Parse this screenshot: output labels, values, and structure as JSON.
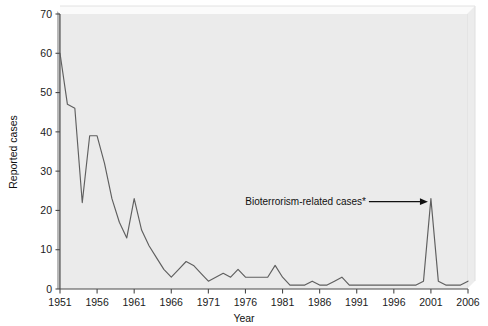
{
  "chart_data": {
    "type": "line",
    "title": "",
    "xlabel": "Year",
    "ylabel": "Reported cases",
    "xlim": [
      1951,
      2006
    ],
    "ylim": [
      0,
      70
    ],
    "grid": false,
    "legend_position": "none",
    "xticks": [
      "1951",
      "1956",
      "1961",
      "1966",
      "1971",
      "1976",
      "1981",
      "1986",
      "1991",
      "1996",
      "2001",
      "2006"
    ],
    "xtick_values": [
      1951,
      1956,
      1961,
      1966,
      1971,
      1976,
      1981,
      1986,
      1991,
      1996,
      2001,
      2006
    ],
    "yticks": [
      "0",
      "10",
      "20",
      "30",
      "40",
      "50",
      "60",
      "70"
    ],
    "ytick_values": [
      0,
      10,
      20,
      30,
      40,
      50,
      60,
      70
    ],
    "series": [
      {
        "name": "Reported cases",
        "color": "#5f5f5f",
        "x": [
          1951,
          1952,
          1953,
          1954,
          1955,
          1956,
          1957,
          1958,
          1959,
          1960,
          1961,
          1962,
          1963,
          1964,
          1965,
          1966,
          1967,
          1968,
          1969,
          1970,
          1971,
          1972,
          1973,
          1974,
          1975,
          1976,
          1977,
          1978,
          1979,
          1980,
          1981,
          1982,
          1983,
          1984,
          1985,
          1986,
          1987,
          1988,
          1989,
          1990,
          1991,
          1992,
          1993,
          1994,
          1995,
          1996,
          1997,
          1998,
          1999,
          2000,
          2001,
          2002,
          2003,
          2004,
          2005,
          2006
        ],
        "values": [
          60,
          47,
          46,
          22,
          39,
          39,
          32,
          23,
          17,
          13,
          23,
          15,
          11,
          8,
          5,
          3,
          5,
          7,
          6,
          4,
          2,
          3,
          4,
          3,
          5,
          3,
          3,
          3,
          3,
          6,
          3,
          1,
          1,
          1,
          2,
          1,
          1,
          2,
          3,
          1,
          1,
          1,
          1,
          1,
          1,
          1,
          1,
          1,
          1,
          2,
          23,
          2,
          1,
          1,
          1,
          2
        ]
      }
    ],
    "annotations": [
      {
        "name": "bioterrorism-annotation",
        "text": "Bioterrorism-related cases*",
        "points_to_x": 2001,
        "points_to_y": 23,
        "arrow": true
      }
    ]
  },
  "axis": {
    "y_title": "Reported cases",
    "x_title": "Year"
  }
}
